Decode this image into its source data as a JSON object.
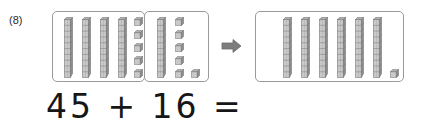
{
  "problem": {
    "number_label": "(8)",
    "equation": "45 + 16 ="
  },
  "arrow": {
    "icon": "arrow-right-icon",
    "direction": "right"
  },
  "colors": {
    "block_face": "#c9c9c9",
    "block_face_light": "#d8d8d8",
    "block_top": "#b0b0b0",
    "block_side": "#8e8e8e",
    "block_outline": "#6f6f6f",
    "box_border": "#9a9a9a",
    "text": "#161616",
    "background": "#ffffff"
  },
  "model": {
    "type": "base-ten-blocks",
    "rod_value": 10,
    "cube_value": 1,
    "addend_1": {
      "name": "first-addend",
      "value": 45,
      "tens_rods": 4,
      "ones_cubes": 5,
      "label": "45"
    },
    "addend_2": {
      "name": "second-addend",
      "value": 16,
      "tens_rods": 1,
      "ones_cubes": 6,
      "label": "16"
    },
    "sum": {
      "name": "sum",
      "value": 61,
      "tens_rods": 6,
      "ones_cubes": 1,
      "label": "61"
    }
  },
  "layout": {
    "addend_1_rods_x": [
      64,
      82,
      100,
      118
    ],
    "addend_1_rods_y": 17,
    "addend_1_cubes": [
      {
        "x": 134,
        "y": 17
      },
      {
        "x": 134,
        "y": 30
      },
      {
        "x": 134,
        "y": 43
      },
      {
        "x": 134,
        "y": 56
      },
      {
        "x": 134,
        "y": 69
      }
    ],
    "addend_2_rods_x": [
      157
    ],
    "addend_2_rods_y": 17,
    "addend_2_cubes": [
      {
        "x": 175,
        "y": 17
      },
      {
        "x": 175,
        "y": 30
      },
      {
        "x": 175,
        "y": 43
      },
      {
        "x": 175,
        "y": 56
      },
      {
        "x": 175,
        "y": 69
      },
      {
        "x": 191,
        "y": 69
      }
    ],
    "sum_rods_x": [
      283,
      301,
      319,
      337,
      355,
      373
    ],
    "sum_rods_y": 17,
    "sum_cubes": [
      {
        "x": 390,
        "y": 69
      }
    ]
  }
}
